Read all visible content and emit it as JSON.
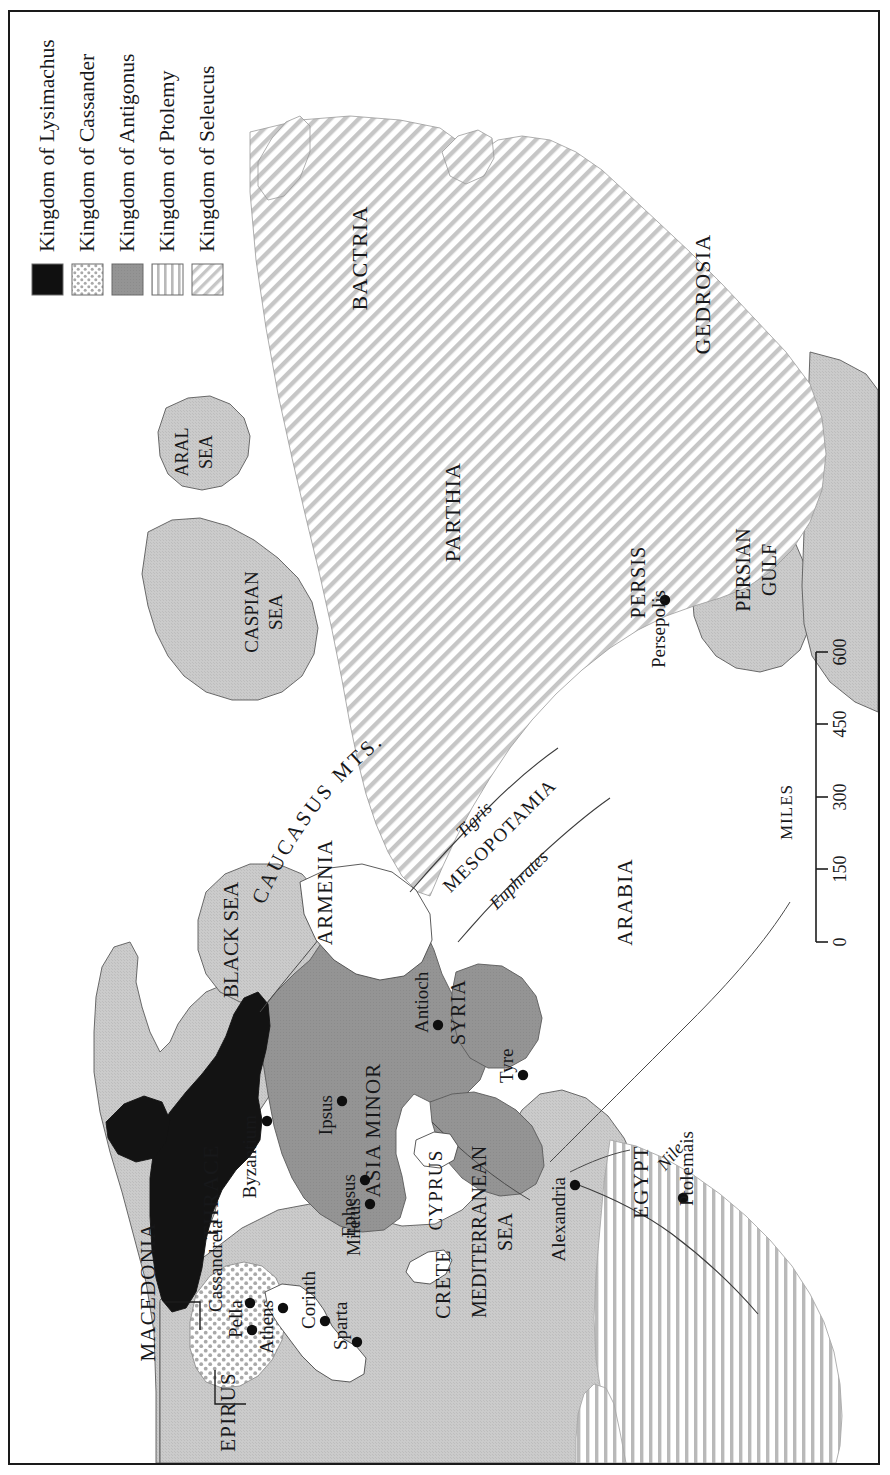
{
  "map": {
    "title": "The Hellenistic Kingdoms after the Death of Alexander",
    "orientation": "rotated-90",
    "frame_color": "#1a1a1a",
    "background_color": "#ffffff",
    "sea_color": "#c9c9c9",
    "land_color": "#ffffff"
  },
  "legend": {
    "items": [
      {
        "label": "Kingdom of Lysimachus",
        "pattern": "solid-black",
        "color": "#101010"
      },
      {
        "label": "Kingdom of Cassander",
        "pattern": "dotted",
        "color": "#8a8a8a"
      },
      {
        "label": "Kingdom of Antigonus",
        "pattern": "solid-gray",
        "color": "#919191"
      },
      {
        "label": "Kingdom of Ptolemy",
        "pattern": "vertical-stripes",
        "color": "#b4b4b4"
      },
      {
        "label": "Kingdom of Seleucus",
        "pattern": "diagonal-stripes",
        "color": "#c2c2c2"
      }
    ]
  },
  "scale": {
    "unit_label": "MILES",
    "ticks": [
      "0",
      "150",
      "300",
      "450",
      "600"
    ]
  },
  "regions": [
    {
      "name": "BACTRIA",
      "kingdom": "Seleucus",
      "style": "uppercase"
    },
    {
      "name": "PARTHIA",
      "kingdom": "Seleucus",
      "style": "uppercase"
    },
    {
      "name": "GEDROSIA",
      "kingdom": "Seleucus",
      "style": "uppercase"
    },
    {
      "name": "PERSIS",
      "kingdom": "Seleucus",
      "style": "uppercase"
    },
    {
      "name": "MESOPOTAMIA",
      "kingdom": "Seleucus",
      "style": "uppercase"
    },
    {
      "name": "ARMENIA",
      "kingdom": "none",
      "style": "uppercase"
    },
    {
      "name": "ARABIA",
      "kingdom": "none",
      "style": "uppercase"
    },
    {
      "name": "ASIA MINOR",
      "kingdom": "Antigonus",
      "style": "uppercase"
    },
    {
      "name": "SYRIA",
      "kingdom": "Antigonus",
      "style": "uppercase"
    },
    {
      "name": "CYPRUS",
      "kingdom": "none",
      "style": "uppercase"
    },
    {
      "name": "THRACE",
      "kingdom": "Lysimachus",
      "style": "uppercase"
    },
    {
      "name": "MACEDONIA",
      "kingdom": "Cassander",
      "style": "uppercase"
    },
    {
      "name": "EPIRUS",
      "kingdom": "none",
      "style": "uppercase"
    },
    {
      "name": "CRETE",
      "kingdom": "none",
      "style": "uppercase"
    },
    {
      "name": "EGYPT",
      "kingdom": "Ptolemy",
      "style": "uppercase"
    }
  ],
  "seas": [
    {
      "name": "ARAL SEA",
      "lines": [
        "ARAL",
        "SEA"
      ]
    },
    {
      "name": "CASPIAN SEA",
      "lines": [
        "CASPIAN",
        "SEA"
      ]
    },
    {
      "name": "BLACK SEA",
      "lines": [
        "BLACK SEA"
      ]
    },
    {
      "name": "PERSIAN GULF",
      "lines": [
        "PERSIAN",
        "GULF"
      ]
    },
    {
      "name": "MEDITERRANEAN SEA",
      "lines": [
        "MEDITERRANEAN",
        "SEA"
      ]
    }
  ],
  "mountains": [
    {
      "name": "CAUCASUS MTS."
    }
  ],
  "rivers": [
    {
      "name": "Tigris"
    },
    {
      "name": "Euphrates"
    },
    {
      "name": "Nile"
    }
  ],
  "cities": [
    {
      "name": "Byzantium",
      "x": 257,
      "y": 1109
    },
    {
      "name": "Ipsus",
      "x": 332,
      "y": 1089
    },
    {
      "name": "Ephesus",
      "x": 355,
      "y": 1168
    },
    {
      "name": "Miletus",
      "x": 360,
      "y": 1192
    },
    {
      "name": "Antioch",
      "x": 428,
      "y": 1013
    },
    {
      "name": "Tyre",
      "x": 513,
      "y": 1063
    },
    {
      "name": "Alexandria",
      "x": 565,
      "y": 1173
    },
    {
      "name": "Ptolemais",
      "x": 673,
      "y": 1186
    },
    {
      "name": "Persepolis",
      "x": 655,
      "y": 588
    },
    {
      "name": "Athens",
      "x": 273,
      "y": 1296
    },
    {
      "name": "Corinth",
      "x": 315,
      "y": 1309
    },
    {
      "name": "Sparta",
      "x": 347,
      "y": 1330
    },
    {
      "name": "Pella",
      "x": 242,
      "y": 1318
    },
    {
      "name": "Cassandreia",
      "x": 240,
      "y": 1291
    }
  ]
}
